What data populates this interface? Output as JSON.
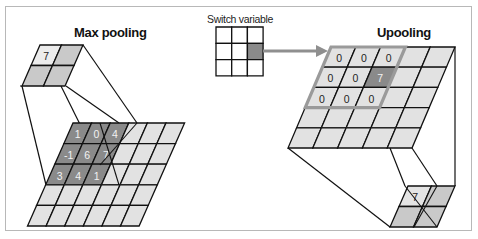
{
  "figure": {
    "colors": {
      "frame": "#b8b8b8",
      "light_cell": "#e2e2e2",
      "dark_cell": "#8a8a8a",
      "line": "#111111",
      "arrow": "#8f8f8f",
      "highlight_border": "#9a9a9a",
      "white_text": "#f2f2f2"
    },
    "max_pooling": {
      "title": "Max pooling",
      "pooled_output": {
        "rows": 2,
        "cols": 2,
        "values": [
          [
            "7",
            ""
          ],
          [
            "",
            ""
          ]
        ],
        "highlighted_cell": [
          0,
          0
        ]
      },
      "input_grid": {
        "rows": 5,
        "cols": 6,
        "dark_region": {
          "rows": 3,
          "cols": 3
        },
        "values": [
          [
            "1",
            "0",
            "4",
            "",
            "",
            ""
          ],
          [
            "-1",
            "6",
            "7",
            "",
            "",
            ""
          ],
          [
            "3",
            "4",
            "1",
            "",
            "",
            ""
          ],
          [
            "",
            "",
            "",
            "",
            "",
            ""
          ],
          [
            "",
            "",
            "",
            "",
            "",
            ""
          ]
        ]
      }
    },
    "switch_variable": {
      "label": "Switch variable",
      "rows": 3,
      "cols": 3,
      "active_cell": [
        1,
        2
      ]
    },
    "unpooling": {
      "title": "Upooling",
      "output_grid": {
        "rows": 5,
        "cols": 5,
        "highlight_region": {
          "rows": 3,
          "cols": 3
        },
        "values": [
          [
            "0",
            "0",
            "0",
            "",
            ""
          ],
          [
            "0",
            "0",
            "7",
            "",
            ""
          ],
          [
            "0",
            "0",
            "0",
            "",
            ""
          ],
          [
            "",
            "",
            "",
            "",
            ""
          ],
          [
            "",
            "",
            "",
            "",
            ""
          ]
        ],
        "active_cell": [
          1,
          2
        ]
      },
      "pooled_input": {
        "rows": 2,
        "cols": 2,
        "values": [
          [
            "7",
            ""
          ],
          [
            "",
            ""
          ]
        ]
      }
    }
  }
}
